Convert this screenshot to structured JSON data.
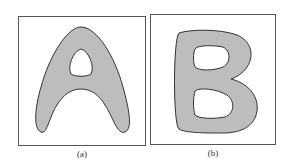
{
  "figure": {
    "panels": [
      {
        "id": "a",
        "letter": "A",
        "caption": "(a)"
      },
      {
        "id": "b",
        "letter": "B",
        "caption": "(b)"
      }
    ],
    "colors": {
      "fill": "#bdbdbd",
      "stroke": "#333333",
      "border": "#555555"
    }
  }
}
